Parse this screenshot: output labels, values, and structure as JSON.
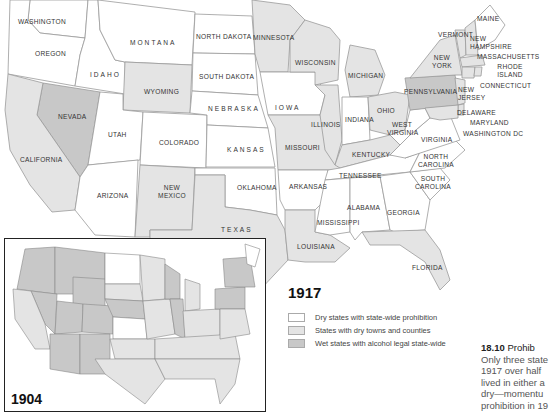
{
  "map": {
    "main_year": "1917",
    "inset_year": "1904",
    "colors": {
      "dry": "#ffffff",
      "towns": "#e4e4e4",
      "wet": "#c8c8c8",
      "border": "#9a9a9a"
    },
    "legend": [
      {
        "category": "dry",
        "label": "Dry states with state-wide prohibition"
      },
      {
        "category": "towns",
        "label": "States with dry towns and counties"
      },
      {
        "category": "wet",
        "label": "Wet states with alcohol legal state-wide"
      }
    ],
    "states": {
      "washington": "WASHINGTON",
      "oregon": "OREGON",
      "montana": "MONTANA",
      "idaho": "IDAHO",
      "wyoming": "WYOMING",
      "nevada": "NEVADA",
      "utah": "UTAH",
      "california": "CALIFORNIA",
      "colorado": "COLORADO",
      "arizona": "ARIZONA",
      "new_mexico": "NEW MEXICO",
      "north_dakota": "NORTH DAKOTA",
      "south_dakota": "SOUTH DAKOTA",
      "nebraska": "NEBRASKA",
      "kansas": "KANSAS",
      "oklahoma": "OKLAHOMA",
      "texas": "TEXAS",
      "minnesota": "MINNESOTA",
      "iowa": "IOWA",
      "missouri": "MISSOURI",
      "arkansas": "ARKANSAS",
      "louisiana": "LOUISIANA",
      "wisconsin": "WISCONSIN",
      "illinois": "ILLINOIS",
      "michigan": "MICHIGAN",
      "indiana": "INDIANA",
      "ohio": "OHIO",
      "kentucky": "KENTUCKY",
      "tennessee": "TENNESSEE",
      "mississippi": "MISSISSIPPI",
      "alabama": "ALABAMA",
      "georgia": "GEORGIA",
      "florida": "FLORIDA",
      "south_carolina": "SOUTH CAROLINA",
      "north_carolina": "NORTH CAROLINA",
      "virginia": "VIRGINIA",
      "west_virginia": "WEST VIRGINIA",
      "pennsylvania": "PENNSYLVANIA",
      "new_york": "NEW YORK",
      "vermont": "VERMONT",
      "new_hampshire": "NEW HAMPSHIRE",
      "maine": "MAINE",
      "massachusetts": "MASSACHUSETTS",
      "rhode_island": "RHODE ISLAND",
      "connecticut": "CONNECTICUT",
      "new_jersey": "NEW JERSEY",
      "delaware": "DELAWARE",
      "maryland": "MARYLAND",
      "washington_dc": "WASHINGTON DC"
    }
  },
  "caption": {
    "number": "18.10",
    "title": "Prohib",
    "lines": [
      "Only three state",
      "1917 over half",
      "lived in either a",
      "dry—momentu",
      "prohibition in 19"
    ]
  }
}
